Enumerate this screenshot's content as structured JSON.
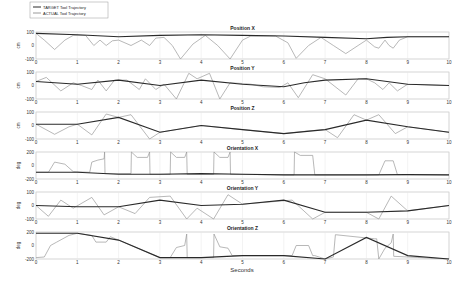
{
  "chart_data": {
    "type": "line",
    "xlabel": "Seconds",
    "xlim": [
      0,
      10
    ],
    "xticks": [
      0,
      1,
      2,
      3,
      4,
      5,
      6,
      7,
      8,
      9,
      10
    ],
    "legend": {
      "position": "top-left",
      "entries": [
        {
          "name": "TARGET Tool Trajectory",
          "color": "#2a2a2a"
        },
        {
          "name": "ACTUAL Tool Trajectory",
          "color": "#9a9a9a"
        }
      ]
    },
    "grid": true,
    "panels": [
      {
        "title": "Position X",
        "ylabel": "cm",
        "ylim": [
          -100,
          100
        ],
        "yticks": [
          -100,
          0,
          100
        ],
        "target": {
          "x": [
            0,
            1,
            2,
            3,
            4,
            5,
            6,
            7,
            8,
            8.5,
            9,
            10
          ],
          "y": [
            90,
            80,
            65,
            75,
            80,
            75,
            70,
            60,
            50,
            60,
            65,
            65
          ]
        },
        "actual": {
          "x": [
            0,
            0.2,
            0.45,
            0.7,
            0.9,
            1.2,
            1.4,
            1.55,
            1.7,
            1.85,
            2.0,
            2.3,
            2.55,
            2.75,
            2.9,
            3.1,
            3.3,
            3.5,
            3.8,
            4.1,
            4.4,
            4.7,
            5.0,
            5.2,
            5.8,
            6.1,
            6.3,
            6.6,
            6.9,
            7.2,
            7.5,
            7.8,
            8.0,
            8.2,
            8.3,
            8.45,
            8.55,
            8.65,
            8.8,
            9.0,
            10
          ],
          "y": [
            90,
            40,
            -30,
            40,
            75,
            75,
            0,
            40,
            0,
            35,
            40,
            0,
            40,
            0,
            55,
            60,
            0,
            -100,
            10,
            75,
            0,
            -100,
            40,
            70,
            70,
            20,
            -95,
            0,
            60,
            0,
            -60,
            0,
            40,
            -10,
            -20,
            40,
            0,
            -20,
            40,
            65,
            65
          ]
        }
      },
      {
        "title": "Position Y",
        "ylabel": "cm",
        "ylim": [
          -100,
          100
        ],
        "yticks": [
          -100,
          0,
          100
        ],
        "target": {
          "x": [
            0,
            1,
            2,
            3,
            4,
            5,
            6,
            6.5,
            7,
            8,
            9,
            10
          ],
          "y": [
            30,
            10,
            40,
            0,
            40,
            10,
            -10,
            20,
            40,
            50,
            10,
            0
          ]
        },
        "actual": {
          "x": [
            0,
            0.25,
            0.6,
            0.9,
            1.1,
            1.35,
            1.5,
            1.7,
            1.9,
            2.2,
            2.5,
            2.65,
            2.9,
            3.1,
            3.4,
            3.7,
            3.9,
            4.2,
            4.45,
            4.7,
            5.0,
            5.2,
            5.5,
            5.9,
            6.1,
            6.35,
            6.7,
            7.0,
            7.5,
            7.8,
            8.0,
            8.2,
            8.4,
            8.55,
            8.75,
            9.0,
            10
          ],
          "y": [
            30,
            60,
            -40,
            20,
            0,
            -30,
            40,
            -40,
            40,
            40,
            -30,
            50,
            -30,
            10,
            -100,
            90,
            50,
            90,
            -100,
            20,
            15,
            10,
            -10,
            -15,
            20,
            -90,
            80,
            50,
            -70,
            50,
            50,
            20,
            -30,
            20,
            -40,
            10,
            0
          ]
        }
      },
      {
        "title": "Position Z",
        "ylabel": "cm",
        "ylim": [
          -100,
          100
        ],
        "yticks": [
          -100,
          0,
          100
        ],
        "target": {
          "x": [
            0,
            1,
            2,
            3,
            4,
            5,
            6,
            7,
            8,
            9,
            10
          ],
          "y": [
            10,
            10,
            60,
            -50,
            0,
            -30,
            -60,
            -30,
            40,
            -10,
            -50
          ]
        },
        "actual": {
          "x": [
            0,
            0.45,
            0.8,
            1.0,
            1.35,
            1.7,
            2.0,
            2.3,
            2.75,
            3.0,
            4.0,
            5.0,
            6.0,
            6.6,
            7.0,
            7.3,
            7.7,
            8.0,
            8.3,
            8.7,
            9.0,
            10
          ],
          "y": [
            10,
            -65,
            -10,
            10,
            -70,
            85,
            60,
            80,
            -100,
            -50,
            0,
            -30,
            -60,
            -40,
            -30,
            -90,
            80,
            40,
            80,
            -60,
            -10,
            -50
          ]
        }
      },
      {
        "title": "Orientation X",
        "ylabel": "deg",
        "ylim": [
          -200,
          200
        ],
        "yticks": [
          -200,
          0,
          200
        ],
        "target": {
          "x": [
            0,
            1,
            2,
            3,
            4,
            5,
            6,
            7,
            8,
            9,
            10
          ],
          "y": [
            -100,
            -100,
            -130,
            -130,
            -120,
            -130,
            -140,
            -140,
            -140,
            -135,
            -140
          ]
        },
        "actual": {
          "x": [
            0,
            0.3,
            0.45,
            0.7,
            0.9,
            1.3,
            1.35,
            1.5,
            1.65,
            1.66,
            1.67,
            2.3,
            2.31,
            2.45,
            2.7,
            2.75,
            2.76,
            3.25,
            3.26,
            3.4,
            3.6,
            3.65,
            3.66,
            4.3,
            4.31,
            4.45,
            4.65,
            4.7,
            4.71,
            6.25,
            6.26,
            6.4,
            6.7,
            6.75,
            8.3,
            8.45,
            8.65,
            8.75,
            10
          ],
          "y": [
            -100,
            -100,
            50,
            20,
            -90,
            -100,
            50,
            80,
            100,
            200,
            -120,
            -120,
            200,
            120,
            120,
            200,
            -130,
            -130,
            200,
            120,
            120,
            200,
            -130,
            -130,
            200,
            120,
            120,
            200,
            -130,
            -140,
            200,
            150,
            150,
            -140,
            -140,
            70,
            70,
            -135,
            -140
          ]
        }
      },
      {
        "title": "Orientation Y",
        "ylabel": "deg",
        "ylim": [
          -100,
          100
        ],
        "yticks": [
          -100,
          0,
          100
        ],
        "target": {
          "x": [
            0,
            1,
            2,
            3,
            4,
            5,
            6,
            7,
            8,
            9,
            10
          ],
          "y": [
            0,
            -10,
            -10,
            40,
            0,
            10,
            40,
            -50,
            -50,
            -40,
            0
          ]
        },
        "actual": {
          "x": [
            0,
            0.3,
            0.6,
            0.9,
            1.35,
            1.65,
            2.0,
            2.4,
            2.75,
            3.25,
            3.65,
            3.9,
            4.3,
            4.65,
            5.0,
            6.2,
            6.7,
            7.0,
            8.0,
            8.3,
            8.6,
            9.0,
            10
          ],
          "y": [
            0,
            -80,
            40,
            -20,
            60,
            -70,
            -10,
            -60,
            60,
            70,
            -100,
            -20,
            -100,
            80,
            10,
            40,
            -100,
            -50,
            -50,
            -100,
            70,
            -40,
            0
          ]
        }
      },
      {
        "title": "Orientation Z",
        "ylabel": "deg",
        "ylim": [
          -200,
          200
        ],
        "yticks": [
          -200,
          0,
          200
        ],
        "target": {
          "x": [
            0,
            1,
            2,
            3,
            4,
            5,
            6,
            7,
            8,
            9,
            10
          ],
          "y": [
            180,
            180,
            80,
            -180,
            -180,
            -150,
            -150,
            -200,
            120,
            -150,
            -200
          ]
        },
        "actual": {
          "x": [
            0,
            0.2,
            0.35,
            0.5,
            0.8,
            1.0,
            1.35,
            1.45,
            1.7,
            1.8,
            2.0,
            3.0,
            3.25,
            3.4,
            3.6,
            3.65,
            3.66,
            4.3,
            4.31,
            4.45,
            4.65,
            4.75,
            6.2,
            6.3,
            6.6,
            6.7,
            6.75,
            7.0,
            7.2,
            7.25,
            8.2,
            8.25,
            8.3,
            8.45,
            8.6,
            8.65,
            8.66,
            10
          ],
          "y": [
            -180,
            -170,
            0,
            50,
            150,
            180,
            150,
            50,
            50,
            130,
            80,
            -180,
            -180,
            -30,
            0,
            170,
            -180,
            -180,
            170,
            -20,
            -40,
            -150,
            -150,
            0,
            0,
            -150,
            -150,
            -200,
            -170,
            160,
            100,
            100,
            -200,
            -40,
            40,
            170,
            -160,
            -200
          ]
        }
      }
    ]
  }
}
